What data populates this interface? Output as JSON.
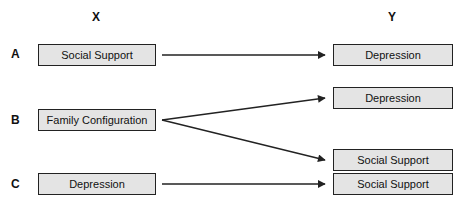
{
  "columns": {
    "x_label": "X",
    "y_label": "Y"
  },
  "rows": [
    {
      "label": "A",
      "x_box": "Social Support",
      "y_boxes": [
        "Depression"
      ]
    },
    {
      "label": "B",
      "x_box": "Family Configuration",
      "y_boxes": [
        "Depression",
        "Social Support"
      ]
    },
    {
      "label": "C",
      "x_box": "Depression",
      "y_boxes": [
        "Social Support"
      ]
    }
  ],
  "colors": {
    "box_fill": "#e4e4e4",
    "box_border": "#222222",
    "arrow": "#222222"
  }
}
